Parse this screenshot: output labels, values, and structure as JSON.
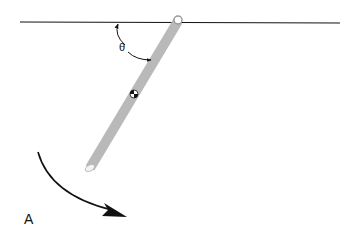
{
  "diagram": {
    "type": "pendulum-rod",
    "labels": {
      "angle": "θ",
      "panel": "A"
    },
    "colors": {
      "line": "#111111",
      "rod": "#b9b9b9",
      "background": "#ffffff"
    },
    "elements": [
      "horizontal reference line",
      "pivot circle",
      "rod",
      "center-of-mass marker",
      "angle arc with arrows",
      "rotation direction arrow"
    ]
  }
}
